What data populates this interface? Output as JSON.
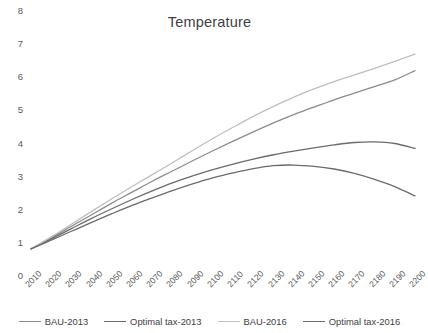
{
  "chart_data": {
    "type": "line",
    "title": "Temperature",
    "xlabel": "",
    "ylabel": "",
    "ylim": [
      0,
      8
    ],
    "ytick_step": 1,
    "grid": false,
    "legend_position": "bottom",
    "background": "#ffffff",
    "yticks": [
      "8",
      "7",
      "6",
      "5",
      "4",
      "3",
      "2",
      "1",
      "0"
    ],
    "categories": [
      "2010",
      "2020",
      "2030",
      "2040",
      "2050",
      "2060",
      "2070",
      "2080",
      "2090",
      "2100",
      "2110",
      "2120",
      "2130",
      "2140",
      "2150",
      "2160",
      "2170",
      "2180",
      "2190",
      "2200"
    ],
    "series": [
      {
        "name": "BAU-2013",
        "color": "#8c8c8c",
        "values": [
          0.82,
          1.15,
          1.5,
          1.85,
          2.2,
          2.53,
          2.86,
          3.17,
          3.48,
          3.78,
          4.07,
          4.35,
          4.62,
          4.87,
          5.1,
          5.32,
          5.52,
          5.72,
          5.92,
          6.2
        ]
      },
      {
        "name": "Optimal tax-2013",
        "color": "#6b6b6b",
        "values": [
          0.82,
          1.12,
          1.43,
          1.74,
          2.03,
          2.31,
          2.57,
          2.81,
          3.02,
          3.21,
          3.38,
          3.53,
          3.66,
          3.77,
          3.87,
          3.96,
          4.03,
          4.05,
          4.0,
          3.85
        ]
      },
      {
        "name": "BAU-2016",
        "color": "#bfbfbf",
        "values": [
          0.82,
          1.18,
          1.56,
          1.95,
          2.33,
          2.7,
          3.06,
          3.42,
          3.79,
          4.15,
          4.49,
          4.82,
          5.12,
          5.4,
          5.65,
          5.87,
          6.07,
          6.27,
          6.48,
          6.7
        ]
      },
      {
        "name": "Optimal tax-2016",
        "color": "#6b6b6b",
        "values": [
          0.82,
          1.08,
          1.35,
          1.62,
          1.88,
          2.13,
          2.36,
          2.58,
          2.78,
          2.96,
          3.11,
          3.24,
          3.33,
          3.35,
          3.31,
          3.23,
          3.1,
          2.92,
          2.7,
          2.42
        ]
      }
    ]
  },
  "legend": {
    "items": [
      {
        "label": "BAU-2013",
        "color": "#8c8c8c"
      },
      {
        "label": "Optimal tax-2013",
        "color": "#6b6b6b"
      },
      {
        "label": "BAU-2016",
        "color": "#bfbfbf"
      },
      {
        "label": "Optimal tax-2016",
        "color": "#6b6b6b"
      }
    ]
  }
}
